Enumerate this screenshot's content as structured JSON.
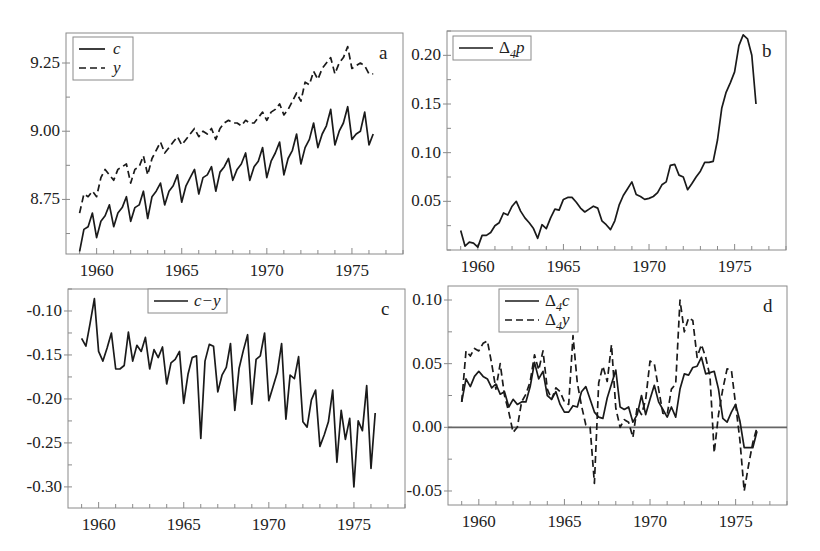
{
  "figure": {
    "panel_letters": [
      "a",
      "b",
      "c",
      "d"
    ]
  },
  "chart_data": [
    {
      "id": "a",
      "type": "line",
      "panel_label": "a",
      "title": "",
      "xlabel": "",
      "ylabel": "",
      "xlim": [
        1958.2,
        1978.0
      ],
      "ylim": [
        8.55,
        9.36
      ],
      "xticks": [
        1960,
        1965,
        1970,
        1975
      ],
      "xtick_labels": [
        "1960",
        "1965",
        "1970",
        "1975"
      ],
      "yticks": [
        8.75,
        9.0,
        9.25
      ],
      "ytick_labels": [
        "8.75",
        "9.00",
        "9.25"
      ],
      "grid": false,
      "legend": {
        "position": "top-left",
        "entries": [
          "c",
          "y"
        ]
      },
      "frame_px": {
        "left": 66,
        "top": 33,
        "right": 403,
        "bottom": 254
      },
      "x_start": 1959.0,
      "x_step": 0.25,
      "series": [
        {
          "name": "c",
          "style": "solid",
          "values": [
            8.56,
            8.64,
            8.65,
            8.7,
            8.61,
            8.67,
            8.69,
            8.73,
            8.65,
            8.7,
            8.72,
            8.76,
            8.67,
            8.72,
            8.73,
            8.78,
            8.68,
            8.76,
            8.78,
            8.81,
            8.73,
            8.78,
            8.8,
            8.84,
            8.74,
            8.8,
            8.83,
            8.86,
            8.77,
            8.83,
            8.84,
            8.87,
            8.78,
            8.85,
            8.87,
            8.9,
            8.82,
            8.86,
            8.88,
            8.92,
            8.82,
            8.87,
            8.89,
            8.94,
            8.83,
            8.89,
            8.92,
            8.96,
            8.84,
            8.9,
            8.93,
            8.99,
            8.88,
            8.94,
            8.97,
            9.03,
            8.94,
            8.99,
            9.02,
            9.08,
            8.95,
            9.0,
            9.03,
            9.09,
            8.97,
            8.99,
            9.0,
            9.07,
            8.95,
            8.99
          ]
        },
        {
          "name": "y",
          "style": "dashed",
          "values": [
            8.7,
            8.77,
            8.76,
            8.78,
            8.76,
            8.83,
            8.86,
            8.84,
            8.82,
            8.86,
            8.87,
            8.88,
            8.81,
            8.86,
            8.87,
            8.91,
            8.84,
            8.9,
            8.93,
            8.96,
            8.92,
            8.94,
            8.96,
            8.98,
            8.95,
            8.97,
            8.99,
            9.01,
            8.98,
            9.0,
            8.99,
            9.01,
            8.97,
            9.01,
            9.03,
            9.04,
            9.03,
            9.03,
            9.02,
            9.04,
            9.03,
            9.03,
            9.05,
            9.07,
            9.04,
            9.07,
            9.08,
            9.1,
            9.06,
            9.08,
            9.11,
            9.14,
            9.11,
            9.18,
            9.17,
            9.22,
            9.19,
            9.23,
            9.25,
            9.27,
            9.21,
            9.25,
            9.27,
            9.31,
            9.23,
            9.24,
            9.25,
            9.24,
            9.21,
            9.21
          ]
        }
      ]
    },
    {
      "id": "b",
      "type": "line",
      "panel_label": "b",
      "title": "",
      "xlabel": "",
      "ylabel": "",
      "xlim": [
        1958.2,
        1978.0
      ],
      "ylim": [
        0.0,
        0.225
      ],
      "xticks": [
        1960,
        1965,
        1970,
        1975
      ],
      "xtick_labels": [
        "1960",
        "1965",
        "1970",
        "1975"
      ],
      "yticks": [
        0.05,
        0.1,
        0.15,
        0.2
      ],
      "ytick_labels": [
        "0.05",
        "0.10",
        "0.15",
        "0.20"
      ],
      "grid": false,
      "legend": {
        "position": "top-left",
        "entries": [
          "Δ4p"
        ]
      },
      "frame_px": {
        "left": 447,
        "top": 31,
        "right": 786,
        "bottom": 250
      },
      "x_start": 1959.0,
      "x_step": 0.25,
      "series": [
        {
          "name": "Δ4p",
          "style": "solid",
          "values": [
            0.02,
            0.004,
            0.008,
            0.007,
            0.003,
            0.015,
            0.015,
            0.018,
            0.025,
            0.028,
            0.038,
            0.036,
            0.045,
            0.05,
            0.04,
            0.033,
            0.028,
            0.022,
            0.012,
            0.026,
            0.022,
            0.033,
            0.042,
            0.041,
            0.052,
            0.054,
            0.054,
            0.049,
            0.043,
            0.039,
            0.042,
            0.045,
            0.043,
            0.03,
            0.026,
            0.021,
            0.03,
            0.046,
            0.056,
            0.063,
            0.07,
            0.057,
            0.055,
            0.052,
            0.053,
            0.055,
            0.059,
            0.067,
            0.07,
            0.087,
            0.088,
            0.077,
            0.075,
            0.062,
            0.068,
            0.075,
            0.081,
            0.09,
            0.09,
            0.091,
            0.113,
            0.146,
            0.162,
            0.172,
            0.183,
            0.21,
            0.221,
            0.217,
            0.2,
            0.15
          ]
        }
      ]
    },
    {
      "id": "c",
      "type": "line",
      "panel_label": "c",
      "title": "",
      "xlabel": "",
      "ylabel": "",
      "xlim": [
        1958.2,
        1978.0
      ],
      "ylim": [
        -0.324,
        -0.075
      ],
      "xticks": [
        1960,
        1965,
        1970,
        1975
      ],
      "xtick_labels": [
        "1960",
        "1965",
        "1970",
        "1975"
      ],
      "yticks": [
        -0.1,
        -0.15,
        -0.2,
        -0.25,
        -0.3
      ],
      "ytick_labels": [
        "-0.10",
        "-0.15",
        "-0.20",
        "-0.25",
        "-0.30"
      ],
      "grid": false,
      "legend": {
        "position": "top-center",
        "entries": [
          "c−y"
        ]
      },
      "frame_px": {
        "left": 68,
        "top": 289,
        "right": 405,
        "bottom": 508
      },
      "x_start": 1959.0,
      "x_step": 0.25,
      "series": [
        {
          "name": "c−y",
          "style": "solid",
          "values": [
            -0.131,
            -0.14,
            -0.114,
            -0.086,
            -0.146,
            -0.157,
            -0.142,
            -0.125,
            -0.166,
            -0.166,
            -0.162,
            -0.124,
            -0.157,
            -0.139,
            -0.146,
            -0.13,
            -0.166,
            -0.144,
            -0.153,
            -0.141,
            -0.183,
            -0.159,
            -0.155,
            -0.146,
            -0.205,
            -0.172,
            -0.153,
            -0.151,
            -0.245,
            -0.157,
            -0.138,
            -0.14,
            -0.192,
            -0.173,
            -0.164,
            -0.137,
            -0.213,
            -0.165,
            -0.145,
            -0.127,
            -0.206,
            -0.155,
            -0.151,
            -0.125,
            -0.202,
            -0.186,
            -0.17,
            -0.137,
            -0.223,
            -0.173,
            -0.177,
            -0.152,
            -0.226,
            -0.232,
            -0.201,
            -0.19,
            -0.254,
            -0.241,
            -0.226,
            -0.19,
            -0.272,
            -0.213,
            -0.246,
            -0.222,
            -0.3,
            -0.225,
            -0.236,
            -0.185,
            -0.279,
            -0.216
          ]
        }
      ]
    },
    {
      "id": "d",
      "type": "line",
      "panel_label": "d",
      "title": "",
      "xlabel": "",
      "ylabel": "",
      "xlim": [
        1958.2,
        1978.0
      ],
      "ylim": [
        -0.061,
        0.111
      ],
      "xticks": [
        1960,
        1965,
        1970,
        1975
      ],
      "xtick_labels": [
        "1960",
        "1965",
        "1970",
        "1975"
      ],
      "yticks": [
        -0.05,
        0.0,
        0.05,
        0.1
      ],
      "ytick_labels": [
        "-0.05",
        "0.00",
        "0.05",
        "0.10"
      ],
      "grid": false,
      "reference_line": 0.0,
      "legend": {
        "position": "top-left",
        "entries": [
          "Δ4c",
          "Δ4y"
        ]
      },
      "frame_px": {
        "left": 448,
        "top": 286,
        "right": 787,
        "bottom": 505
      },
      "x_start": 1959.0,
      "x_step": 0.25,
      "series": [
        {
          "name": "Δ4c",
          "style": "solid",
          "values": [
            0.02,
            0.038,
            0.032,
            0.04,
            0.044,
            0.04,
            0.038,
            0.031,
            0.034,
            0.026,
            0.028,
            0.016,
            0.022,
            0.018,
            0.02,
            0.02,
            0.032,
            0.051,
            0.038,
            0.044,
            0.025,
            0.022,
            0.028,
            0.018,
            0.012,
            0.012,
            0.017,
            0.016,
            0.028,
            0.032,
            0.022,
            0.012,
            0.008,
            0.007,
            0.023,
            0.034,
            0.045,
            0.016,
            0.014,
            0.016,
            0.004,
            0.01,
            0.025,
            0.01,
            0.022,
            0.033,
            0.02,
            0.014,
            0.008,
            0.016,
            0.008,
            0.03,
            0.042,
            0.041,
            0.047,
            0.048,
            0.055,
            0.042,
            0.043,
            0.044,
            0.03,
            0.007,
            0.004,
            0.012,
            0.018,
            0.005,
            -0.016,
            -0.016,
            -0.016,
            -0.003
          ]
        },
        {
          "name": "Δ4y",
          "style": "dashed",
          "values": [
            0.02,
            0.06,
            0.056,
            0.062,
            0.06,
            0.066,
            0.068,
            0.05,
            0.03,
            0.05,
            0.025,
            0.012,
            -0.004,
            0.0,
            0.02,
            0.026,
            0.036,
            0.057,
            0.045,
            0.06,
            0.03,
            0.022,
            0.031,
            0.028,
            0.02,
            0.018,
            0.072,
            0.035,
            0.017,
            0.002,
            0.0,
            -0.044,
            0.035,
            0.048,
            0.036,
            0.065,
            0.015,
            0.0,
            0.006,
            0.004,
            -0.008,
            0.016,
            0.01,
            0.022,
            0.052,
            0.05,
            0.03,
            0.011,
            0.01,
            0.03,
            0.034,
            0.1,
            0.075,
            0.086,
            0.084,
            0.055,
            0.065,
            0.055,
            0.04,
            -0.02,
            0.01,
            0.03,
            0.046,
            0.045,
            0.018,
            -0.01,
            -0.05,
            -0.03,
            -0.012,
            0.0
          ]
        }
      ]
    }
  ]
}
